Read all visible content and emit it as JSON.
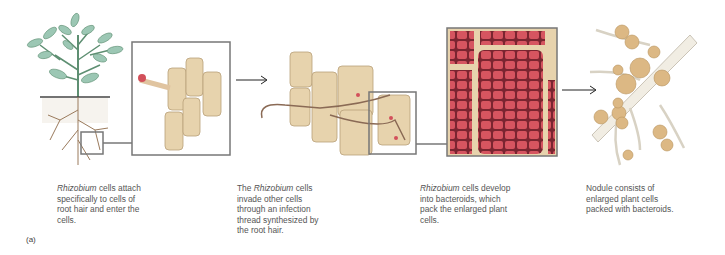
{
  "figure": {
    "label": "(a)",
    "panels": [
      {
        "id": "plant-root",
        "caption": {
          "italic": "Rhizobium",
          "rest": " cells attach specifically to cells of root hair and enter the cells."
        }
      },
      {
        "id": "infection-thread",
        "caption": {
          "pre": "The ",
          "italic": "Rhizobium",
          "rest": " cells invade other cells through an infection thread synthesized by the root hair."
        }
      },
      {
        "id": "bacteroids",
        "caption": {
          "italic": "Rhizobium",
          "rest": " cells develop into bacteroids, which pack the enlarged plant cells."
        }
      },
      {
        "id": "nodule",
        "caption": {
          "text": "Nodule consists of enlarged plant cells packed with bacteroids."
        }
      }
    ]
  },
  "colors": {
    "leaf": "#9cc7b4",
    "stem": "#5e8f72",
    "root": "#9a7a5c",
    "cell": "#e7d3ad",
    "bacteroid": "#d2505a",
    "frame": "#777777",
    "nodule": "#dcb884"
  }
}
